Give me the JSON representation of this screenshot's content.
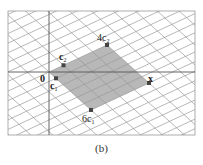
{
  "figure": {
    "caption": "(b)",
    "frame": {
      "x": 8,
      "y": 11,
      "width": 187,
      "height": 124
    },
    "origin": {
      "x": 49,
      "y": 72
    },
    "basis": {
      "c1": {
        "dx": 7,
        "dy": 6.33
      },
      "c2": {
        "dx": 14.5,
        "dy": -6.75
      }
    },
    "colors": {
      "grid": "#9a9a9a",
      "axis": "#555555",
      "frame": "#999999",
      "parallelogram": "#b8b8b8",
      "point": "#444444",
      "text": "#222222"
    },
    "labels": {
      "origin": "0",
      "c1": "c",
      "c1_sub": "1",
      "c2": "c",
      "c2_sub": "2",
      "four_c2": "4c",
      "four_c2_sub": "2",
      "six_c1": "6c",
      "six_c1_sub": "1",
      "x": "x"
    },
    "points": [
      {
        "name": "c1",
        "coeffs": [
          1,
          0
        ]
      },
      {
        "name": "c2",
        "coeffs": [
          0,
          1
        ]
      },
      {
        "name": "4c2",
        "coeffs": [
          0,
          4
        ]
      },
      {
        "name": "6c1",
        "coeffs": [
          6,
          0
        ]
      },
      {
        "name": "x",
        "coeffs": [
          6,
          4
        ]
      }
    ],
    "shaded_region": {
      "c1_range": [
        0,
        6
      ],
      "c2_range": [
        0,
        4
      ]
    }
  }
}
